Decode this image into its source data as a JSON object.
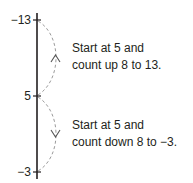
{
  "diagram": {
    "type": "number-line-vertical",
    "ticks": [
      {
        "label": "−13",
        "position": "top"
      },
      {
        "label": "5",
        "position": "middle"
      },
      {
        "label": "−3",
        "position": "bottom"
      }
    ],
    "annotations": [
      {
        "line1": "Start at 5 and",
        "line2": "count up 8 to 13.",
        "arrow": "up"
      },
      {
        "line1": "Start at 5 and",
        "line2": "count down 8 to −3.",
        "arrow": "down"
      }
    ],
    "colors": {
      "axis": "#231f20",
      "arc": "#9a9a9a",
      "text": "#231f20"
    }
  }
}
